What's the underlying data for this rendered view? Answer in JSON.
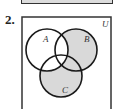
{
  "problem": {
    "number": "2.",
    "universe_label": "U",
    "sets": [
      {
        "label": "A",
        "cx": 47,
        "cy": 50,
        "r": 21
      },
      {
        "label": "B",
        "cx": 76,
        "cy": 50,
        "r": 21
      },
      {
        "label": "C",
        "cx": 61,
        "cy": 76,
        "r": 21
      }
    ],
    "shaded_region": "(B ∪ C) − A",
    "colors": {
      "shade": "#d9d9d9",
      "stroke": "#1a1a1a",
      "box": "#333333"
    }
  }
}
